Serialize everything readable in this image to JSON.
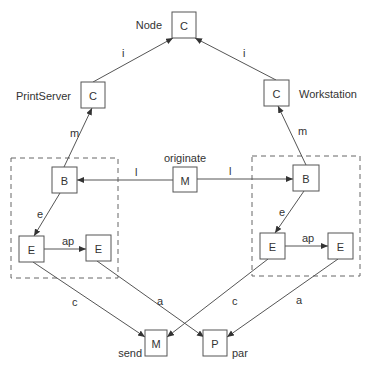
{
  "diagram": {
    "nodes": [
      {
        "id": "node_c",
        "label": "C",
        "caption": "Node",
        "x": 172,
        "y": 12,
        "w": 24,
        "h": 26,
        "cx": 162,
        "cy": 25,
        "anchor": "end"
      },
      {
        "id": "printserver_c",
        "label": "C",
        "caption": "PrintServer",
        "x": 81,
        "y": 82,
        "w": 24,
        "h": 26,
        "cx": 71,
        "cy": 96,
        "anchor": "end"
      },
      {
        "id": "workstation_c",
        "label": "C",
        "caption": "Workstation",
        "x": 264,
        "y": 80,
        "w": 25,
        "h": 26,
        "cx": 299,
        "cy": 94,
        "anchor": "start"
      },
      {
        "id": "left_b",
        "label": "B",
        "caption": "",
        "x": 52,
        "y": 167,
        "w": 25,
        "h": 26
      },
      {
        "id": "originate_m",
        "label": "M",
        "caption": "originate",
        "x": 173,
        "y": 167,
        "w": 24,
        "h": 25,
        "cx": 185,
        "cy": 158,
        "anchor": "middle"
      },
      {
        "id": "right_b",
        "label": "B",
        "caption": "",
        "x": 293,
        "y": 165,
        "w": 26,
        "h": 26
      },
      {
        "id": "left_e1",
        "label": "E",
        "caption": "",
        "x": 19,
        "y": 236,
        "w": 25,
        "h": 26
      },
      {
        "id": "left_e2",
        "label": "E",
        "caption": "",
        "x": 86,
        "y": 235,
        "w": 25,
        "h": 26
      },
      {
        "id": "right_e1",
        "label": "E",
        "caption": "",
        "x": 260,
        "y": 233,
        "w": 25,
        "h": 26
      },
      {
        "id": "right_e2",
        "label": "E",
        "caption": "",
        "x": 328,
        "y": 233,
        "w": 25,
        "h": 26
      },
      {
        "id": "send_m",
        "label": "M",
        "caption": "send",
        "x": 145,
        "y": 330,
        "w": 22,
        "h": 26,
        "cx": 142,
        "cy": 353,
        "anchor": "end"
      },
      {
        "id": "par_p",
        "label": "P",
        "caption": "par",
        "x": 203,
        "y": 330,
        "w": 24,
        "h": 26,
        "cx": 232,
        "cy": 353,
        "anchor": "start"
      }
    ],
    "edges": [
      {
        "id": "ps_to_node",
        "label": "i",
        "x1": 93,
        "y1": 82,
        "x2": 173,
        "y2": 38,
        "lx": 122,
        "ly": 57
      },
      {
        "id": "ws_to_node",
        "label": "i",
        "x1": 276,
        "y1": 80,
        "x2": 195,
        "y2": 38,
        "lx": 243,
        "ly": 57
      },
      {
        "id": "lb_to_ps",
        "label": "m",
        "x1": 64,
        "y1": 167,
        "x2": 92,
        "y2": 108,
        "lx": 70,
        "ly": 137
      },
      {
        "id": "rb_to_ws",
        "label": "m",
        "x1": 306,
        "y1": 165,
        "x2": 278,
        "y2": 106,
        "lx": 298,
        "ly": 135
      },
      {
        "id": "m_to_lb",
        "label": "l",
        "x1": 173,
        "y1": 180,
        "x2": 77,
        "y2": 180,
        "lx": 135,
        "ly": 176
      },
      {
        "id": "m_to_rb",
        "label": "l",
        "x1": 197,
        "y1": 179,
        "x2": 293,
        "y2": 179,
        "lx": 229,
        "ly": 175
      },
      {
        "id": "lb_to_le1",
        "label": "e",
        "x1": 60,
        "y1": 193,
        "x2": 34,
        "y2": 236,
        "lx": 37,
        "ly": 218
      },
      {
        "id": "rb_to_re1",
        "label": "e",
        "x1": 304,
        "y1": 191,
        "x2": 275,
        "y2": 233,
        "lx": 279,
        "ly": 216
      },
      {
        "id": "le1_to_le2",
        "label": "ap",
        "x1": 44,
        "y1": 249,
        "x2": 86,
        "y2": 249,
        "lx": 62,
        "ly": 245
      },
      {
        "id": "re1_to_re2",
        "label": "ap",
        "x1": 285,
        "y1": 246,
        "x2": 328,
        "y2": 246,
        "lx": 302,
        "ly": 242
      },
      {
        "id": "le1_to_send",
        "label": "c",
        "x1": 33,
        "y1": 262,
        "x2": 145,
        "y2": 337,
        "lx": 72,
        "ly": 306
      },
      {
        "id": "re1_to_send",
        "label": "c",
        "x1": 268,
        "y1": 259,
        "x2": 167,
        "y2": 337,
        "lx": 232,
        "ly": 305
      },
      {
        "id": "le2_to_par",
        "label": "a",
        "x1": 97,
        "y1": 261,
        "x2": 204,
        "y2": 337,
        "lx": 157,
        "ly": 305
      },
      {
        "id": "re2_to_par",
        "label": "a",
        "x1": 338,
        "y1": 259,
        "x2": 227,
        "y2": 337,
        "lx": 296,
        "ly": 304
      }
    ],
    "groups": [
      {
        "id": "left_group",
        "x": 11,
        "y": 158,
        "w": 107,
        "h": 120
      },
      {
        "id": "right_group",
        "x": 252,
        "y": 156,
        "w": 108,
        "h": 120
      }
    ]
  }
}
